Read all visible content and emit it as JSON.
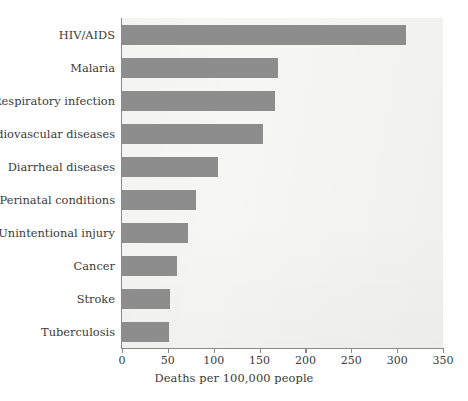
{
  "chart_data": {
    "type": "bar",
    "orientation": "horizontal",
    "title": "",
    "xlabel": "Deaths per 100,000 people",
    "ylabel": "",
    "xlim": [
      0,
      350
    ],
    "xticks": [
      0,
      50,
      100,
      150,
      200,
      250,
      300,
      350
    ],
    "grid": false,
    "legend": null,
    "categories": [
      "HIV/AIDS",
      "Malaria",
      "Respiratory infection",
      "Cardiovascular diseases",
      "Diarrheal diseases",
      "Perinatal conditions",
      "Unintentional injury",
      "Cancer",
      "Stroke",
      "Tuberculosis"
    ],
    "values": [
      310,
      170,
      167,
      154,
      105,
      81,
      72,
      60,
      52,
      51
    ],
    "bar_color": "#8d8d8d",
    "plot_background": "#f6f6f4",
    "axis_color": "#8a8a86",
    "text_color": "#3a3a3a"
  }
}
